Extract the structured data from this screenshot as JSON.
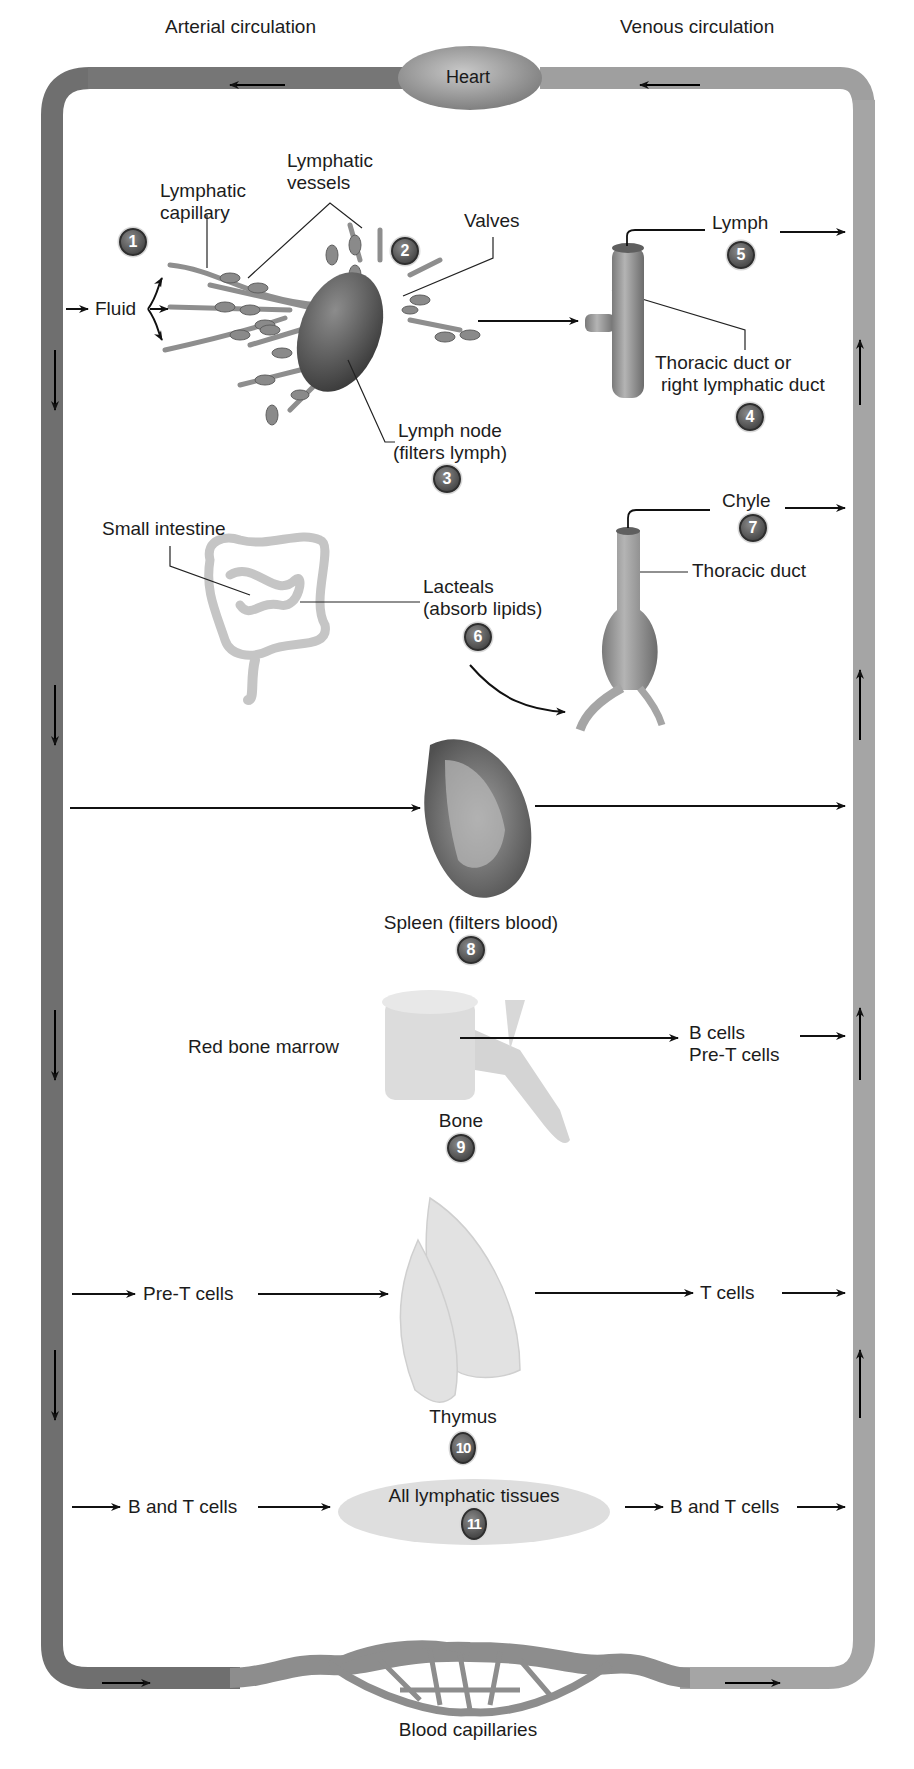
{
  "diagram": {
    "colors": {
      "vessel_arterial": "#6e6e6e",
      "vessel_venous": "#a9a9a9",
      "heart": "#9a9a9a",
      "badge": "#5a5a5a",
      "tissue_ellipse": "#dedede",
      "text": "#1c1c1c"
    },
    "top": {
      "arterial_label": "Arterial circulation",
      "venous_label": "Venous circulation",
      "heart_label": "Heart"
    },
    "bottom": {
      "capillaries_label": "Blood capillaries"
    },
    "section1": {
      "fluid_label": "Fluid",
      "lymphatic_capillary_label": [
        "Lymphatic",
        "capillary"
      ],
      "lymphatic_vessels_label": [
        "Lymphatic",
        "vessels"
      ],
      "valves_label": "Valves",
      "lymph_node_label": [
        "Lymph node",
        "(filters lymph)"
      ],
      "duct_label": [
        "Thoracic duct or",
        "right lymphatic duct"
      ],
      "lymph_label": "Lymph",
      "badges": {
        "capillary": "1",
        "vessels": "2",
        "node": "3",
        "duct": "4",
        "lymph": "5"
      }
    },
    "section2": {
      "small_intestine_label": "Small intestine",
      "lacteals_label": [
        "Lacteals",
        "(absorb lipids)"
      ],
      "thoracic_duct_label": "Thoracic duct",
      "chyle_label": "Chyle",
      "badges": {
        "lacteals": "6",
        "chyle": "7"
      }
    },
    "section3": {
      "spleen_label": "Spleen (filters blood)",
      "badge": "8"
    },
    "section4": {
      "marrow_label": "Red bone marrow",
      "bone_label": "Bone",
      "output_label": [
        "B cells",
        "Pre-T cells"
      ],
      "badge": "9"
    },
    "section5": {
      "input_label": "Pre-T cells",
      "thymus_label": "Thymus",
      "output_label": "T cells",
      "badge": "10"
    },
    "section6": {
      "input_label": "B and T cells",
      "tissues_label": "All lymphatic tissues",
      "output_label": "B and T cells",
      "badge": "11"
    }
  }
}
